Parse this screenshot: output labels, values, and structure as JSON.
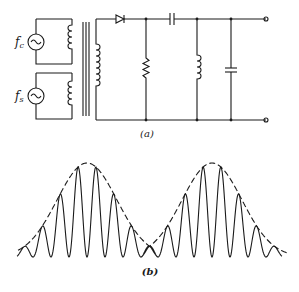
{
  "figure": {
    "part_a": {
      "label": "(a)",
      "sources": [
        {
          "symbol": "f",
          "subscript": "c",
          "name": "carrier-source"
        },
        {
          "symbol": "f",
          "subscript": "s",
          "name": "signal-source"
        }
      ],
      "components": [
        "transformer",
        "diode",
        "resistor",
        "series-capacitor",
        "shunt-inductor",
        "shunt-capacitor",
        "output-terminals"
      ]
    },
    "part_b": {
      "label": "(b)",
      "description": "Amplitude-modulated waveform with dashed envelope, two envelope lobes"
    }
  }
}
